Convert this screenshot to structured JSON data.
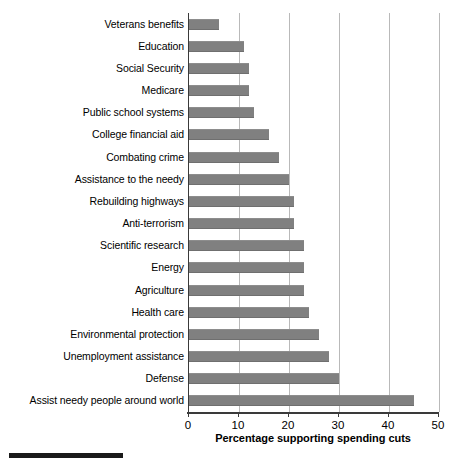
{
  "chart_data": {
    "type": "bar",
    "orientation": "horizontal",
    "title": "",
    "xlabel": "Percentage supporting spending cuts",
    "ylabel": "",
    "xlim": [
      0,
      50
    ],
    "xticks": [
      0,
      10,
      20,
      30,
      40,
      50
    ],
    "xtick_labels": [
      "0",
      "10",
      "20",
      "30",
      "40",
      "50"
    ],
    "grid": "vertical",
    "legend": "none",
    "bar_color": "#808080",
    "axis_color": "#3a3a3a",
    "gridline_color": "#b9b9b9",
    "categories": [
      "Veterans benefits",
      "Education",
      "Social Security",
      "Medicare",
      "Public school systems",
      "College financial aid",
      "Combating crime",
      "Assistance to the needy",
      "Rebuilding highways",
      "Anti-terrorism",
      "Scientific research",
      "Energy",
      "Agriculture",
      "Health care",
      "Environmental protection",
      "Unemployment assistance",
      "Defense",
      "Assist needy people around world"
    ],
    "values": [
      6,
      11,
      12,
      12,
      13,
      16,
      18,
      20,
      21,
      21,
      23,
      23,
      23,
      24,
      26,
      28,
      30,
      45
    ]
  },
  "footer": {
    "rule": ""
  }
}
